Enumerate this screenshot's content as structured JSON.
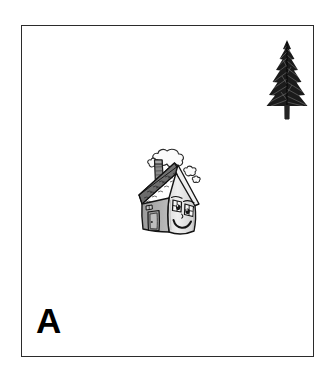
{
  "figure": {
    "panel_label": "A",
    "background_color": "#ffffff",
    "border_color": "#2b2b2b",
    "objects": [
      {
        "id": "house",
        "name": "cartoon-house-with-face",
        "description": "Smiling cartoon house with chimney and smoke puffs",
        "position": {
          "x": 107,
          "y": 116,
          "width": 80,
          "height": 100
        },
        "colors": {
          "wall_light": "#e9e9e9",
          "wall_shadow": "#b4b4b4",
          "roof": "#8d8d8d",
          "roof_dark": "#6a6a6a",
          "outline": "#1a1a1a",
          "smoke": "#f4f4f4"
        },
        "features": [
          "chimney",
          "smoke",
          "shingle-roof",
          "two-eyes",
          "smile",
          "door",
          "window"
        ]
      },
      {
        "id": "tree",
        "name": "pine-tree",
        "description": "Dark conifer / fir tree silhouette",
        "position": {
          "x": 244,
          "y": 14,
          "width": 42,
          "height": 80
        },
        "colors": {
          "foliage": "#1c1c1c",
          "trunk": "#2a2a2a"
        }
      }
    ]
  }
}
